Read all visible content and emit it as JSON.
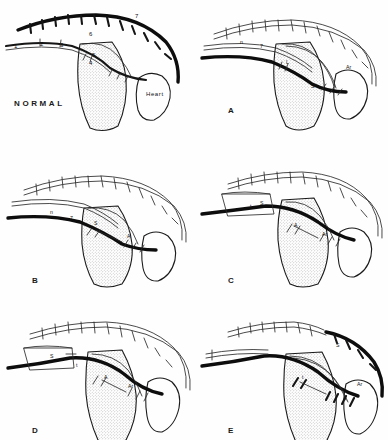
{
  "figure": {
    "type": "anatomical-line-drawing",
    "panel_count": 6,
    "background_color": "#fefefe",
    "ink_color": "#0d0d0d",
    "stipple_color": "#6f6f6f"
  },
  "panels": [
    {
      "id": "normal",
      "caption": "NORMAL",
      "organ_label": "Heart",
      "number_labels": [
        {
          "text": "1",
          "x": 14,
          "y": 48
        },
        {
          "text": "2",
          "x": 40,
          "y": 46
        },
        {
          "text": "3",
          "x": 60,
          "y": 47
        },
        {
          "text": "4",
          "x": 89,
          "y": 65
        },
        {
          "text": "5",
          "x": 92,
          "y": 57
        },
        {
          "text": "6",
          "x": 89,
          "y": 36
        },
        {
          "text": "7",
          "x": 135,
          "y": 18
        }
      ],
      "letter_labels": []
    },
    {
      "id": "a",
      "caption": "A",
      "organ_label": "",
      "number_labels": [],
      "letter_labels": [
        {
          "text": "n",
          "x": 46,
          "y": 44
        },
        {
          "text": "7",
          "x": 66,
          "y": 48
        },
        {
          "text": "L",
          "x": 92,
          "y": 64
        },
        {
          "text": "Ar",
          "x": 152,
          "y": 69
        },
        {
          "text": "S",
          "x": 117,
          "y": 88
        }
      ]
    },
    {
      "id": "b",
      "caption": "B",
      "organ_label": "",
      "number_labels": [],
      "letter_labels": [
        {
          "text": "n",
          "x": 50,
          "y": 66
        },
        {
          "text": "7",
          "x": 70,
          "y": 72
        },
        {
          "text": "S",
          "x": 94,
          "y": 77
        },
        {
          "text": "A",
          "x": 127,
          "y": 90
        }
      ]
    },
    {
      "id": "c",
      "caption": "C",
      "organ_label": "",
      "number_labels": [],
      "letter_labels": [
        {
          "text": "t",
          "x": 56,
          "y": 60
        },
        {
          "text": "S",
          "x": 66,
          "y": 57
        },
        {
          "text": "A",
          "x": 100,
          "y": 79
        },
        {
          "text": "Ar",
          "x": 128,
          "y": 88
        }
      ]
    },
    {
      "id": "d",
      "caption": "D",
      "organ_label": "",
      "number_labels": [],
      "letter_labels": [
        {
          "text": "S",
          "x": 50,
          "y": 58
        },
        {
          "text": "t",
          "x": 76,
          "y": 67
        },
        {
          "text": "A",
          "x": 104,
          "y": 79
        },
        {
          "text": "Ar",
          "x": 128,
          "y": 88
        }
      ]
    },
    {
      "id": "e",
      "caption": "E",
      "organ_label": "",
      "number_labels": [],
      "letter_labels": [
        {
          "text": "S",
          "x": 142,
          "y": 47
        },
        {
          "text": "n",
          "x": 38,
          "y": 63
        },
        {
          "text": "t",
          "x": 108,
          "y": 79
        },
        {
          "text": "Ar",
          "x": 163,
          "y": 86
        }
      ]
    }
  ],
  "legend_keys": {
    "one": "1",
    "two": "2",
    "three": "3",
    "four": "4",
    "five": "5",
    "six": "6",
    "seven": "7",
    "heart": "Heart"
  }
}
